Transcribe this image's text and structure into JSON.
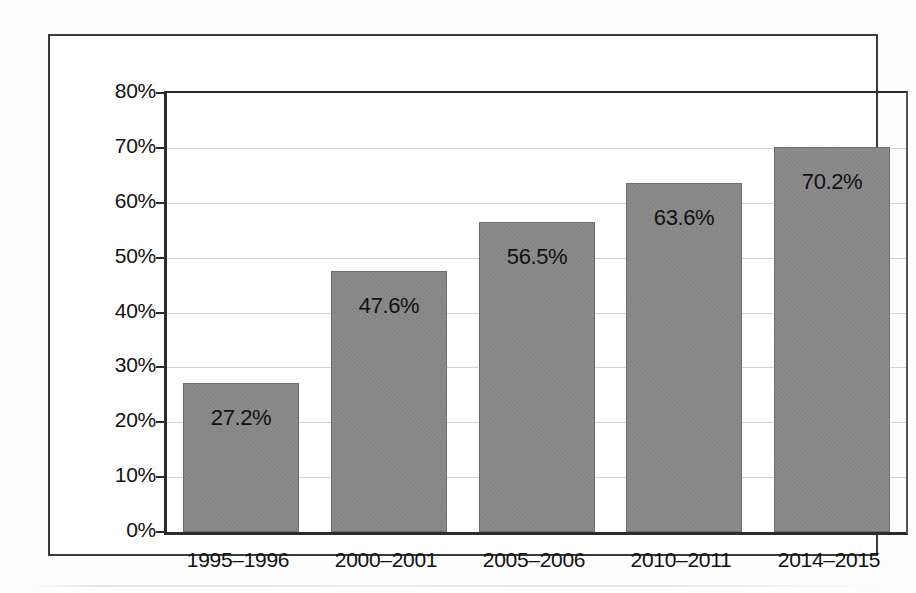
{
  "chart_data": {
    "type": "bar",
    "title": "",
    "subtitle": "",
    "xlabel": "",
    "ylabel": "",
    "categories": [
      "1995–1996",
      "2000–2001",
      "2005–2006",
      "2010–2011",
      "2014–2015"
    ],
    "values": [
      27.2,
      47.6,
      56.5,
      63.6,
      70.2
    ],
    "data_labels": [
      "27.2%",
      "47.6%",
      "56.5%",
      "63.6%",
      "70.2%"
    ],
    "ylim": [
      0,
      80
    ],
    "ytick_values": [
      0,
      10,
      20,
      30,
      40,
      50,
      60,
      70,
      80
    ],
    "ytick_labels": [
      "0%",
      "10%",
      "20%",
      "30%",
      "40%",
      "50%",
      "60%",
      "70%",
      "80%"
    ],
    "grid": true,
    "grid_axis": "y",
    "legend": false,
    "legend_position": "none",
    "bar_color": "#8d8d8d",
    "bar_edge_color": "#5a5a5a",
    "label_color": "#111111",
    "axis_color": "#2b2b2b",
    "gridline_color": "#d3d3d3",
    "frame_color": "#3a3a3a",
    "background_color": "#ffffff",
    "annotations": []
  }
}
